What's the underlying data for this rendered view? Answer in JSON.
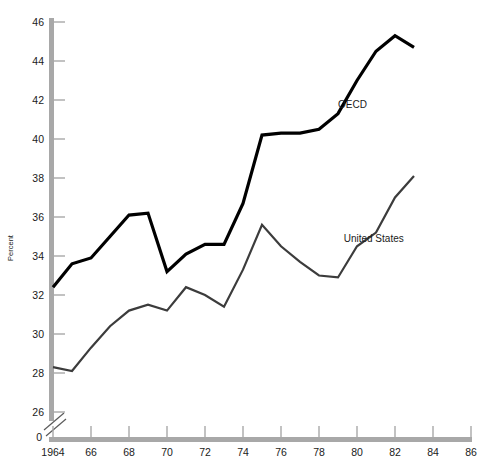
{
  "chart_data": {
    "type": "line",
    "title": "",
    "subtitle": "",
    "xlabel": "",
    "ylabel": "Percent",
    "xlim": [
      1964,
      1987
    ],
    "ylim": [
      25.2,
      46.5
    ],
    "y_axis_break": true,
    "y_zero_label": "0",
    "grid": false,
    "legend_position": "inline-annotation",
    "x_ticks": [
      1964,
      1966,
      1968,
      1970,
      1972,
      1974,
      1976,
      1978,
      1980,
      1982,
      1984,
      1986
    ],
    "x_tick_labels": [
      "1964",
      "66",
      "68",
      "70",
      "72",
      "74",
      "76",
      "78",
      "80",
      "82",
      "84",
      "86"
    ],
    "y_ticks": [
      26,
      28,
      30,
      32,
      34,
      36,
      38,
      40,
      42,
      44,
      46
    ],
    "y_tick_labels": [
      "26",
      "28",
      "30",
      "32",
      "34",
      "36",
      "38",
      "40",
      "42",
      "44",
      "46"
    ],
    "x": [
      1964,
      1965,
      1966,
      1967,
      1968,
      1969,
      1970,
      1971,
      1972,
      1973,
      1974,
      1975,
      1976,
      1977,
      1978,
      1979,
      1980,
      1981,
      1982,
      1983
    ],
    "series": [
      {
        "name": "OECD",
        "color": "#000000",
        "line_width": 3.2,
        "label_x": 1979.0,
        "label_y": 41.6,
        "values": [
          32.4,
          33.6,
          33.9,
          35.0,
          36.1,
          36.2,
          33.2,
          34.1,
          34.6,
          34.6,
          36.7,
          40.2,
          40.3,
          40.3,
          40.5,
          41.3,
          43.0,
          44.5,
          45.3,
          44.7
        ]
      },
      {
        "name": "United States",
        "color": "#3c3c3c",
        "line_width": 2.2,
        "label_x": 1979.3,
        "label_y": 34.7,
        "values": [
          28.3,
          28.1,
          29.3,
          30.4,
          31.2,
          31.5,
          31.2,
          32.4,
          32.0,
          31.4,
          33.3,
          35.6,
          34.5,
          33.7,
          33.0,
          32.9,
          34.5,
          35.2,
          37.0,
          38.1
        ]
      }
    ]
  },
  "annotations": {
    "oecd_label": "OECD",
    "us_label": "United States"
  },
  "axis": {
    "y_title": "Percent",
    "zero_label": "0"
  },
  "colors": {
    "axis": "#a8a8a8",
    "text": "#1a1a1a",
    "oecd": "#000000",
    "united_states": "#3c3c3c",
    "background": "#ffffff"
  }
}
